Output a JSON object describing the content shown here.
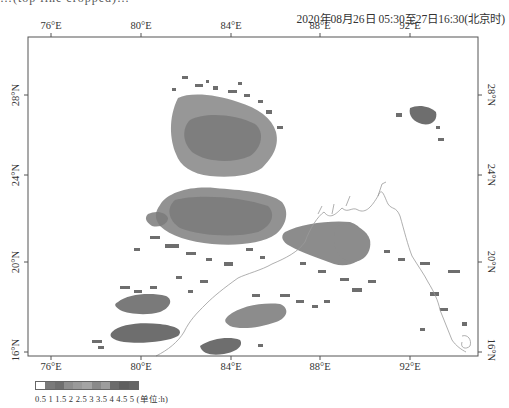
{
  "header": {
    "cropped_top_text": "…(top line cropped)…",
    "time_range": "2020年08月26日  05:30至27日16:30(北京时)"
  },
  "map": {
    "frame": {
      "left": 28,
      "top": 37,
      "right": 478,
      "bottom": 356
    },
    "lon_ticks": [
      {
        "label": "76°E",
        "x": 51
      },
      {
        "label": "80°E",
        "x": 141
      },
      {
        "label": "84°E",
        "x": 231
      },
      {
        "label": "88°E",
        "x": 320
      },
      {
        "label": "92°E",
        "x": 410
      }
    ],
    "lat_ticks": [
      {
        "label": "28°N",
        "y": 95
      },
      {
        "label": "24°N",
        "y": 175
      },
      {
        "label": "20°N",
        "y": 262
      },
      {
        "label": "16°N",
        "y": 352
      }
    ],
    "colors": {
      "frame": "#555555",
      "coast": "#9a9a9a",
      "precip_dark": "#6e6e6e",
      "precip_mid": "#8c8c8c",
      "precip_light": "#a8a8a8"
    }
  },
  "legend": {
    "swatches": [
      "#ffffff",
      "#7a7a7a",
      "#6f6f6f",
      "#8e8e8e",
      "#9a9a9a",
      "#a4a4a4",
      "#8a8a8a",
      "#9d9d9d",
      "#6c6c6c",
      "#5f5f5f",
      "#656565"
    ],
    "labels": "0.5 1 1.5 2 2.5 3  3.5 4 4.5 5 (单位:h)",
    "unit": "h"
  }
}
